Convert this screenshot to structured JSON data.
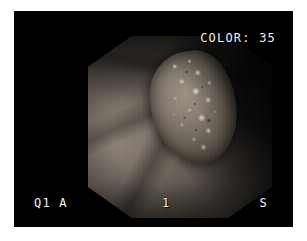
{
  "capture": {
    "kind": "endoscopy-video-frame",
    "frame_background": "#000000",
    "page_background": "#ffffff",
    "overlays": {
      "color_label": "COLOR: 35",
      "quadrant_label": "Q1 A",
      "index_label": "1",
      "side_label": "S",
      "text_color": "#f2f2f2"
    },
    "scene": {
      "aperture_shape": "octagon",
      "mucosa_color": "#7b7167",
      "lesion_color": "#8a7f73",
      "shadow_color": "#080707"
    }
  }
}
